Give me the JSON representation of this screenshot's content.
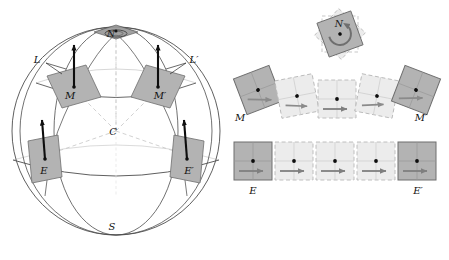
{
  "figure": {
    "background_color": "#ffffff"
  },
  "colors": {
    "solid_fill": "#b3b3b3",
    "solid_stroke": "#6e6e6e",
    "faded_fill": "#ececec",
    "faded_stroke": "#b9b9b9",
    "sphere_stroke": "#4d4d4d",
    "dashed_radial": "#c4c4c4",
    "arrow_dark": "#111111",
    "arrow_gray": "#8a8a8a",
    "label_color": "#111111",
    "pole_fill": "#9a9a9a"
  },
  "sphere_panel": {
    "name": "sphere-diagram",
    "labels": {
      "north_pole": "N",
      "south_pole": "S",
      "center": "C",
      "left_meridian": "L",
      "right_meridian": "L′",
      "mid_left": "M",
      "mid_right": "M′",
      "equator_left": "E",
      "equator_right": "E′"
    },
    "center_point": {
      "x": 116,
      "y": 131
    },
    "radius": 104,
    "vector_markers": [
      {
        "label": "M",
        "x": 72,
        "y": 89,
        "rotation": -22,
        "arrow_angle": -90
      },
      {
        "label": "M′",
        "x": 161,
        "y": 89,
        "rotation": 22,
        "arrow_angle": -90
      },
      {
        "label": "E",
        "x": 43,
        "y": 163,
        "rotation": -10,
        "arrow_angle": -82
      },
      {
        "label": "E′",
        "x": 189,
        "y": 163,
        "rotation": 10,
        "arrow_angle": -82
      }
    ]
  },
  "transport_panel": {
    "name": "transport-sequences",
    "pole_rotation": {
      "label": "N",
      "center": {
        "x": 340,
        "y": 34
      },
      "rotation": -20,
      "size": 36,
      "description": "holonomy-rotation-square"
    },
    "middle_latitude_row": {
      "name": "latitude-transport-row",
      "start_label": "M",
      "end_label": "M′",
      "square_count": 5,
      "squares": [
        {
          "index": 0,
          "cx": 258,
          "cy": 90,
          "rotation": -21,
          "state": "solid",
          "arrow_angle": 24
        },
        {
          "index": 1,
          "cx": 297,
          "cy": 96,
          "rotation": -11,
          "state": "faded",
          "arrow_angle": 14
        },
        {
          "index": 2,
          "cx": 337,
          "cy": 99,
          "rotation": 0,
          "state": "faded",
          "arrow_angle": 0
        },
        {
          "index": 3,
          "cx": 377,
          "cy": 96,
          "rotation": 11,
          "state": "faded",
          "arrow_angle": -14
        },
        {
          "index": 4,
          "cx": 416,
          "cy": 90,
          "rotation": 21,
          "state": "solid",
          "arrow_angle": -24
        }
      ]
    },
    "equator_row": {
      "name": "equator-transport-row",
      "start_label": "E",
      "end_label": "E′",
      "square_count": 5,
      "squares": [
        {
          "index": 0,
          "cx": 253,
          "cy": 161,
          "rotation": 0,
          "state": "solid",
          "arrow_angle": 0
        },
        {
          "index": 1,
          "cx": 294,
          "cy": 161,
          "rotation": 0,
          "state": "faded",
          "arrow_angle": 0
        },
        {
          "index": 2,
          "cx": 335,
          "cy": 161,
          "rotation": 0,
          "state": "faded",
          "arrow_angle": 0
        },
        {
          "index": 3,
          "cx": 376,
          "cy": 161,
          "rotation": 0,
          "state": "faded",
          "arrow_angle": 0
        },
        {
          "index": 4,
          "cx": 417,
          "cy": 161,
          "rotation": 0,
          "state": "solid",
          "arrow_angle": 0
        }
      ]
    }
  },
  "label_positions": {
    "sphere_N": {
      "x": 108,
      "y": 27
    },
    "sphere_S": {
      "x": 112,
      "y": 224
    },
    "sphere_C": {
      "x": 113,
      "y": 132
    },
    "sphere_L": {
      "x": 37,
      "y": 61
    },
    "sphere_Lp": {
      "x": 180,
      "y": 61
    },
    "sphere_M": {
      "x": 63,
      "y": 95
    },
    "sphere_Mp": {
      "x": 152,
      "y": 95
    },
    "sphere_E": {
      "x": 39,
      "y": 174
    },
    "sphere_Ep": {
      "x": 184,
      "y": 174
    },
    "row_M": {
      "x": 240,
      "y": 118
    },
    "row_Mp": {
      "x": 418,
      "y": 118
    },
    "row_E": {
      "x": 250,
      "y": 190
    },
    "row_Ep": {
      "x": 413,
      "y": 190
    },
    "pole_N": {
      "x": 339,
      "y": 26
    }
  }
}
